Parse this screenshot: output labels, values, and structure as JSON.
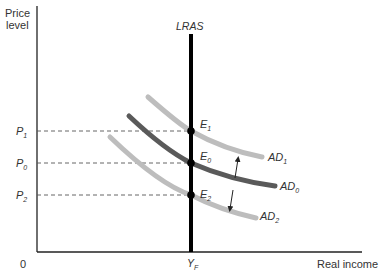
{
  "diagram": {
    "type": "AD-AS model",
    "y_axis_label_line1": "Price",
    "y_axis_label_line2": "level",
    "x_axis_label": "Real income",
    "origin_label": "0",
    "lras_label": "LRAS",
    "yf_label": "Y",
    "yf_sub": "F",
    "price_levels": [
      {
        "label": "P",
        "sub": "1"
      },
      {
        "label": "P",
        "sub": "0"
      },
      {
        "label": "P",
        "sub": "2"
      }
    ],
    "equilibria": [
      {
        "label": "E",
        "sub": "1"
      },
      {
        "label": "E",
        "sub": "0"
      },
      {
        "label": "E",
        "sub": "2"
      }
    ],
    "curves": [
      {
        "label": "AD",
        "sub": "1",
        "color": "#bdbdbd"
      },
      {
        "label": "AD",
        "sub": "0",
        "color": "#5a5a5a"
      },
      {
        "label": "AD",
        "sub": "2",
        "color": "#bdbdbd"
      }
    ],
    "colors": {
      "axis": "#222222",
      "lras": "#000000",
      "dashed": "#555555",
      "text": "#333333"
    }
  }
}
